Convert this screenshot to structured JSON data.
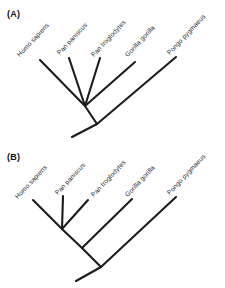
{
  "figure": {
    "background_color": "#ffffff",
    "line_color": "#1c1c1c",
    "text_color": "#2b2b2b"
  },
  "panels": [
    {
      "id": "A",
      "label": "(A)",
      "topology_type": "polytomy",
      "description": "Unresolved cladogram: Homo sapiens, Pan paniscus, Pan troglodytes and Gorilla gorilla radiate from a single node; Pongo pygmaeus branches from the root.",
      "taxa": [
        {
          "name": "Homo sapiens",
          "tip_x": 40,
          "tip_y": 60,
          "label_x": 18,
          "label_y": 52
        },
        {
          "name": "Pan paniscus",
          "tip_x": 69,
          "tip_y": 58,
          "label_x": 58,
          "label_y": 50
        },
        {
          "name": "Pan troglodytes",
          "tip_x": 100,
          "tip_y": 58,
          "label_x": 92,
          "label_y": 52
        },
        {
          "name": "Gorilla gorilla",
          "tip_x": 135,
          "tip_y": 62,
          "label_x": 126,
          "label_y": 52
        },
        {
          "name": "Pongo pygmaeus",
          "tip_x": 176,
          "tip_y": 57,
          "label_x": 168,
          "label_y": 50
        }
      ],
      "nodes": [
        {
          "id": "polytomy",
          "x": 85,
          "y": 106
        },
        {
          "id": "root",
          "x": 97,
          "y": 124
        }
      ],
      "root_stem": {
        "x": 72,
        "y": 137
      }
    },
    {
      "id": "B",
      "label": "(B)",
      "topology_type": "resolved",
      "description": "Fully resolved cladogram: (((Homo sapiens, Pan paniscus), Pan troglodytes), Gorilla gorilla), Pongo pygmaeus.",
      "taxa": [
        {
          "name": "Homo sapiens",
          "tip_x": 33,
          "tip_y": 200,
          "label_x": 16,
          "label_y": 194
        },
        {
          "name": "Pan paniscus",
          "tip_x": 63,
          "tip_y": 196,
          "label_x": 56,
          "label_y": 190
        },
        {
          "name": "Pan troglodytes",
          "tip_x": 88,
          "tip_y": 200,
          "label_x": 92,
          "label_y": 192
        },
        {
          "name": "Gorilla gorilla",
          "tip_x": 132,
          "tip_y": 199,
          "label_x": 126,
          "label_y": 192
        },
        {
          "name": "Pongo pygmaeus",
          "tip_x": 176,
          "tip_y": 197,
          "label_x": 168,
          "label_y": 190
        }
      ],
      "nodes": [
        {
          "id": "homo-pan-node",
          "x": 62,
          "y": 229
        },
        {
          "id": "pan-clade-node",
          "x": 82,
          "y": 248
        },
        {
          "id": "african-ape-node",
          "x": 101,
          "y": 267
        }
      ],
      "root_stem": {
        "x": 76,
        "y": 281
      }
    }
  ]
}
